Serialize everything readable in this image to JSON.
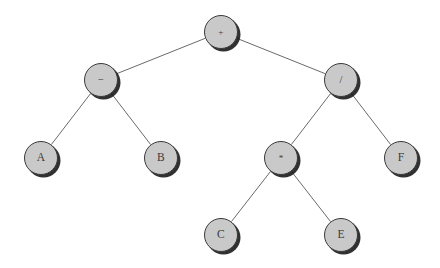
{
  "figure": {
    "name": "binary-expression-tree",
    "background_color": "#ffffff",
    "width": 440,
    "height": 268
  },
  "style": {
    "node_fill": "#c9c9c9",
    "node_stroke": "#3a3a3a",
    "node_shadow": "#141414",
    "edge_color": "#595959",
    "label_color": "#3b3b3b",
    "node_radius": 17
  },
  "chart_data": {
    "type": "diagram",
    "title": "",
    "expression": "(A - B) + ((C * E) / F)",
    "root": "n-plus",
    "nodes": [
      {
        "id": "n-plus",
        "label": "+",
        "kind": "operator",
        "x": 221,
        "y": 32,
        "depth": 0
      },
      {
        "id": "n-minus",
        "label": "−",
        "kind": "operator",
        "x": 101,
        "y": 80,
        "depth": 1
      },
      {
        "id": "n-div",
        "label": "/",
        "kind": "operator",
        "x": 341,
        "y": 80,
        "depth": 1
      },
      {
        "id": "n-a",
        "label": "A",
        "kind": "operand",
        "x": 41,
        "y": 158,
        "depth": 2
      },
      {
        "id": "n-b",
        "label": "B",
        "kind": "operand",
        "x": 161,
        "y": 158,
        "depth": 2
      },
      {
        "id": "n-mul",
        "label": "*",
        "kind": "operator",
        "x": 281,
        "y": 158,
        "depth": 2
      },
      {
        "id": "n-f",
        "label": "F",
        "kind": "operand",
        "x": 401,
        "y": 158,
        "depth": 2
      },
      {
        "id": "n-c",
        "label": "C",
        "kind": "operand",
        "x": 221,
        "y": 235,
        "depth": 3
      },
      {
        "id": "n-e",
        "label": "E",
        "kind": "operand",
        "x": 341,
        "y": 235,
        "depth": 3
      }
    ],
    "edges": [
      {
        "from": "n-plus",
        "to": "n-minus",
        "side": "left"
      },
      {
        "from": "n-plus",
        "to": "n-div",
        "side": "right"
      },
      {
        "from": "n-minus",
        "to": "n-a",
        "side": "left"
      },
      {
        "from": "n-minus",
        "to": "n-b",
        "side": "right"
      },
      {
        "from": "n-div",
        "to": "n-mul",
        "side": "left"
      },
      {
        "from": "n-div",
        "to": "n-f",
        "side": "right"
      },
      {
        "from": "n-mul",
        "to": "n-c",
        "side": "left"
      },
      {
        "from": "n-mul",
        "to": "n-e",
        "side": "right"
      }
    ]
  }
}
